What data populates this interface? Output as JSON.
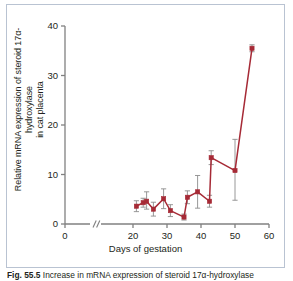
{
  "figure": {
    "caption_label": "Fig. 55.5",
    "caption_text": "Increase in mRNA expression of steroid 17α-hydroxylase"
  },
  "colors": {
    "series": "#a62a36",
    "errorbar": "#8c8c8c",
    "axis": "#808080",
    "frame": "#b9c3d2",
    "text": "#231f20",
    "background": "#ffffff"
  },
  "chart_data": {
    "type": "line",
    "title": "",
    "xlabel": "Days of gestation",
    "ylabel_line1": "Relative mRNA expression of steroid 17α-hydroxylase",
    "ylabel_line2": "in cat placenta",
    "xlim": [
      0,
      60
    ],
    "ylim": [
      0,
      40
    ],
    "xticks": [
      0,
      20,
      30,
      40,
      50,
      60
    ],
    "xticklabels": [
      "0",
      "20",
      "30",
      "40",
      "50",
      "60"
    ],
    "yticks": [
      0,
      10,
      20,
      30,
      40
    ],
    "yticklabels": [
      "0",
      "10",
      "20",
      "30",
      "40"
    ],
    "axis_break": {
      "present": true,
      "symbol": "//",
      "between": [
        0,
        20
      ]
    },
    "grid": false,
    "legend": null,
    "marker": "square",
    "series": [
      {
        "name": "steroid 17α-hydroxylase mRNA",
        "x": [
          21,
          23,
          24,
          26,
          29,
          31,
          35,
          36,
          39,
          42.5,
          43,
          50,
          55
        ],
        "y": [
          3.6,
          4.3,
          4.6,
          3.0,
          5.1,
          2.7,
          1.4,
          5.4,
          6.5,
          4.6,
          13.4,
          10.8,
          35.5
        ],
        "yerr_lower": [
          1.1,
          0.9,
          1.6,
          1.4,
          2.0,
          1.2,
          0.6,
          1.3,
          3.3,
          1.2,
          1.4,
          6.0,
          0.7
        ],
        "yerr_upper": [
          1.1,
          0.9,
          1.9,
          1.4,
          2.0,
          1.2,
          0.6,
          1.3,
          3.3,
          1.2,
          1.4,
          6.3,
          0.7
        ]
      }
    ]
  }
}
